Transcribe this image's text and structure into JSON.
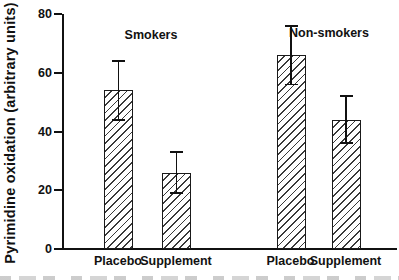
{
  "chart_data": {
    "type": "bar",
    "title": "",
    "xlabel": "",
    "ylabel": "Pyrimidine oxidation (arbitrary units)",
    "ylim": [
      0,
      80
    ],
    "yticks": [
      0,
      20,
      40,
      60,
      80
    ],
    "grid": false,
    "legend": "none",
    "bar_fill": "diagonal-hatch",
    "error_bars": true,
    "groups": [
      {
        "label": "Smokers",
        "bars": [
          {
            "category": "Placebo",
            "value": 54,
            "error": 10
          },
          {
            "category": "Supplement",
            "value": 26,
            "error": 7
          }
        ]
      },
      {
        "label": "Non-smokers",
        "bars": [
          {
            "category": "Placebo",
            "value": 66,
            "error": 10
          },
          {
            "category": "Supplement",
            "value": 44,
            "error": 8
          }
        ]
      }
    ],
    "colors": {
      "axis": "#111111",
      "bar_border": "#1a1a1a",
      "hatch": "#3a3a3a",
      "background": "#ffffff"
    }
  }
}
